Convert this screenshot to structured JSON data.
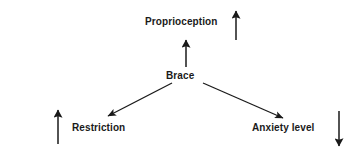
{
  "diagram": {
    "type": "radial-effect-diagram",
    "background_color": "#ffffff",
    "stroke_color": "#1a1a1a",
    "text_color": "#1a1a1a",
    "center": {
      "id": "brace",
      "label": "Brace"
    },
    "nodes": [
      {
        "id": "proprioception",
        "label": "Proprioception",
        "direction": "up",
        "indicator": "up-arrow",
        "indicator_glyph": "↑"
      },
      {
        "id": "restriction",
        "label": "Restriction",
        "direction": "down-left",
        "indicator": "up-arrow",
        "indicator_glyph": "↑"
      },
      {
        "id": "anxiety-level",
        "label": "Anxiety level",
        "direction": "down-right",
        "indicator": "down-arrow",
        "indicator_glyph": "↓"
      }
    ],
    "connectors": [
      {
        "from": "brace",
        "to": "proprioception"
      },
      {
        "from": "brace",
        "to": "restriction"
      },
      {
        "from": "brace",
        "to": "anxiety-level"
      }
    ]
  }
}
